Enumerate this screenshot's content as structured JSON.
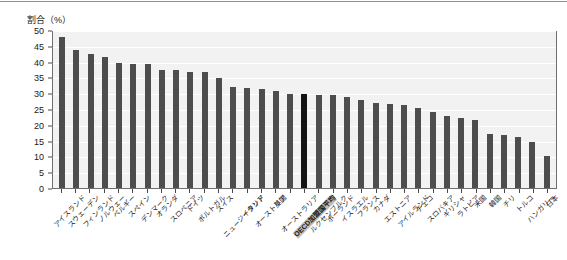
{
  "axis_title": "割合（%）",
  "chart_data": {
    "type": "bar",
    "title": "割合（%）",
    "xlabel": "",
    "ylabel": "割合（%）",
    "ylim": [
      0,
      50
    ],
    "yticks": [
      50,
      45,
      40,
      35,
      30,
      25,
      20,
      15,
      10,
      5,
      0
    ],
    "grid": true,
    "legend": "none",
    "highlight_category": "OECD加盟国平均",
    "bar_color": "#4d4d4d",
    "highlight_color": "#141414",
    "plot_background": "#f2f2f2",
    "categories": [
      "アイスランド",
      "スウェーデン",
      "フィンランド",
      "ノルウェー",
      "ベルギー",
      "スペイン",
      "デンマーク",
      "オランダ",
      "スロベニア",
      "ドイツ",
      "ポルトガル",
      "スイス",
      "ニュージーランド",
      "イタリア",
      "オーストリア",
      "英国",
      "オーストラリア",
      "OECD加盟国平均",
      "ルクセンブルク",
      "ポーランド",
      "イスラエル",
      "フランス",
      "カナダ",
      "エストニア",
      "アイルランド",
      "チェコ",
      "スロバキア",
      "ギリシャ",
      "ラトビア",
      "米国",
      "韓国",
      "チリ",
      "トルコ",
      "ハンガリー",
      "日本"
    ],
    "values": [
      47.7,
      43.7,
      42.3,
      41.5,
      39.6,
      39.4,
      39.2,
      37.4,
      37.2,
      36.7,
      36.6,
      34.8,
      32.1,
      31.5,
      31.2,
      30.7,
      29.7,
      29.6,
      29.5,
      29.3,
      28.8,
      27.8,
      26.8,
      26.5,
      26.3,
      25.4,
      24.0,
      22.8,
      22.3,
      21.6,
      17.2,
      16.7,
      16.3,
      14.6,
      10.2
    ]
  }
}
